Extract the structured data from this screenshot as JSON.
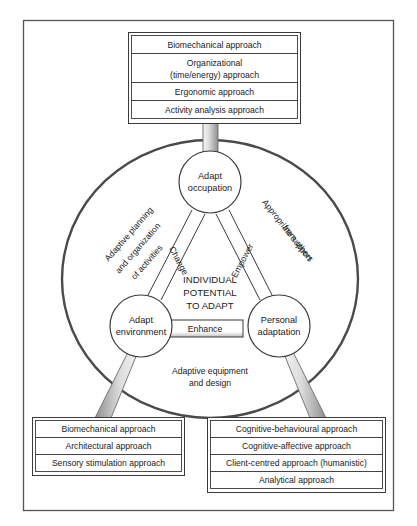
{
  "figure": {
    "title_present": false,
    "colors": {
      "stroke": "#333333",
      "outer_border": "#555555",
      "ellipse_stroke": "#4a4a4a",
      "box_fill": "#ffffff",
      "bar_gray_light": "#f0f0f0",
      "bar_gray_dark": "#9a9a9a",
      "text": "#1a1a1a"
    }
  },
  "top_group": {
    "name": "occupation-approaches",
    "items": [
      {
        "label": "Biomechanical approach"
      },
      {
        "label": "Organizational",
        "label2": "(time/energy) approach"
      },
      {
        "label": "Ergonomic approach"
      },
      {
        "label": "Activity analysis approach"
      }
    ]
  },
  "bottom_left_group": {
    "name": "environment-approaches",
    "items": [
      {
        "label": "Biomechanical approach"
      },
      {
        "label": "Architectural approach"
      },
      {
        "label": "Sensory stimulation approach"
      }
    ]
  },
  "bottom_right_group": {
    "name": "personal-adaptation-approaches",
    "items": [
      {
        "label": "Cognitive-behavioural approach"
      },
      {
        "label": "Cognitive-affective approach"
      },
      {
        "label": "Client-centred approach (humanistic)"
      },
      {
        "label": "Analytical approach"
      }
    ]
  },
  "nodes": {
    "top": {
      "line1": "Adapt",
      "line2": "occupation"
    },
    "left": {
      "line1": "Adapt",
      "line2": "environment"
    },
    "right": {
      "line1": "Personal",
      "line2": "adaptation"
    }
  },
  "center": {
    "line1": "INDIVIDUAL",
    "line2": "POTENTIAL",
    "line3": "TO ADAPT"
  },
  "edges": {
    "change": "Change",
    "empower": "Empower",
    "enhance": "Enhance"
  },
  "outer_labels": {
    "left": {
      "line1": "Adaptive planning",
      "line2": "and organization",
      "line3": "of activities"
    },
    "right": {
      "line1": "Appropriate support",
      "line2": "from others"
    },
    "bottom": {
      "line1": "Adaptive equipment",
      "line2": "and design"
    }
  }
}
